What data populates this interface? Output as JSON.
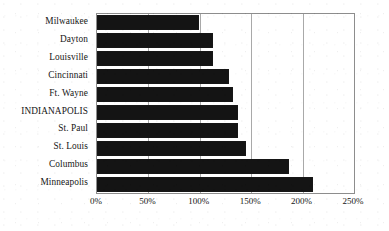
{
  "chart_data": {
    "type": "bar",
    "orientation": "horizontal",
    "title": "",
    "subtitle": "",
    "xlabel": "",
    "ylabel": "",
    "xlim": [
      0,
      250
    ],
    "grid": true,
    "legend": null,
    "value_suffix": "%",
    "xticks": [
      "0%",
      "50%",
      "100%",
      "150%",
      "200%",
      "250%"
    ],
    "xtick_values": [
      0,
      50,
      100,
      150,
      200,
      250
    ],
    "categories": [
      "Milwaukee",
      "Dayton",
      "Louisville",
      "Cincinnati",
      "Ft. Wayne",
      "INDIANAPOLIS",
      "St. Paul",
      "St. Louis",
      "Columbus",
      "Minneapolis"
    ],
    "values": [
      99,
      113,
      113,
      128,
      132,
      137,
      137,
      145,
      187,
      210
    ],
    "bar_color": "#141414",
    "gridline_color": "#a9a9a9",
    "axis_color": "#8d8d8d",
    "background_color": "#ffffff"
  }
}
